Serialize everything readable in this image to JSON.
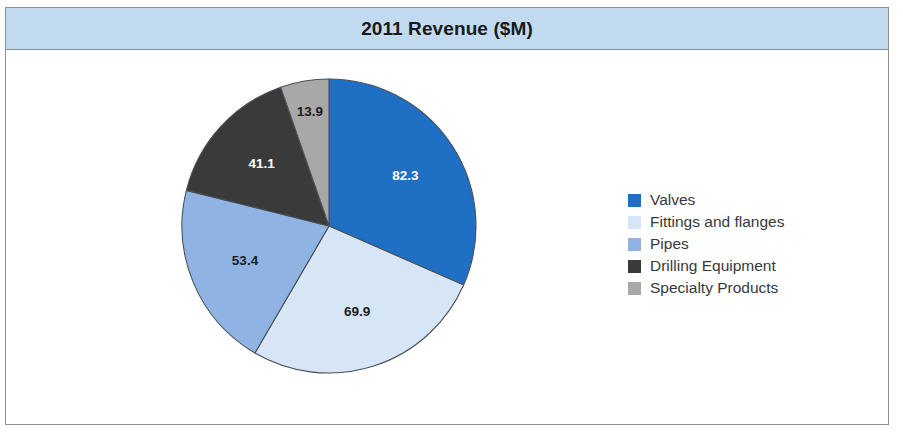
{
  "chart": {
    "title": "2011 Revenue ($M)",
    "title_bar_color": "#C2DAF0",
    "frame_border_color": "#8B8F93",
    "background": "#FFFFFF"
  },
  "chart_data": {
    "type": "pie",
    "title": "2011 Revenue ($M)",
    "xlabel": "",
    "ylabel": "",
    "unit": "$M",
    "total": 260.6,
    "start_angle_deg": 0,
    "direction": "clockwise",
    "legend_position": "right",
    "grid": false,
    "categories": [
      "Valves",
      "Fittings and flanges",
      "Pipes",
      "Drilling Equipment",
      "Specialty Products"
    ],
    "values": [
      82.3,
      69.9,
      53.4,
      41.1,
      13.9
    ],
    "colors": [
      "#1F6FC4",
      "#D6E6F7",
      "#8FB4E3",
      "#3A3A3A",
      "#A8A8A8"
    ],
    "label_colors": [
      "#FFFFFF",
      "#1B1C1E",
      "#1B1C1E",
      "#FFFFFF",
      "#1B1C1E"
    ],
    "slices": [
      {
        "label": "Valves",
        "value": 82.3,
        "display": "82.3",
        "color": "#1F6FC4",
        "label_color": "#FFFFFF",
        "percent": 31.6
      },
      {
        "label": "Fittings and flanges",
        "value": 69.9,
        "display": "69.9",
        "color": "#D6E6F7",
        "label_color": "#1B1C1E",
        "percent": 26.8
      },
      {
        "label": "Pipes",
        "value": 53.4,
        "display": "53.4",
        "color": "#8FB4E3",
        "label_color": "#1B1C1E",
        "percent": 20.5
      },
      {
        "label": "Drilling Equipment",
        "value": 41.1,
        "display": "41.1",
        "color": "#3A3A3A",
        "label_color": "#FFFFFF",
        "percent": 15.8
      },
      {
        "label": "Specialty Products",
        "value": 13.9,
        "display": "13.9",
        "color": "#A8A8A8",
        "label_color": "#1B1C1E",
        "percent": 5.3
      }
    ]
  },
  "legend": {
    "items": [
      {
        "label": "Valves",
        "color": "#1F6FC4"
      },
      {
        "label": "Fittings and flanges",
        "color": "#D6E6F7"
      },
      {
        "label": "Pipes",
        "color": "#8FB4E3"
      },
      {
        "label": "Drilling Equipment",
        "color": "#3A3A3A"
      },
      {
        "label": "Specialty Products",
        "color": "#A8A8A8"
      }
    ]
  }
}
